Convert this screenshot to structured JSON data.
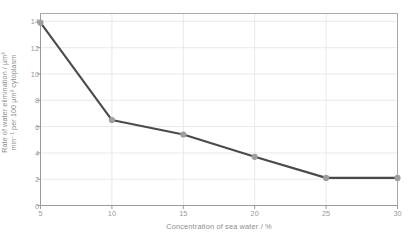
{
  "chart_data": {
    "type": "line",
    "title": "",
    "subtitle": "",
    "xlabel": "Concentration of sea water / %",
    "ylabel": "Rate of water elimination / µm³ min⁻¹ per 100 µm³ cytoplasm",
    "ylabel_line1": "Rate of water elimination / µm³",
    "ylabel_line2": "min⁻¹ per 100 µm³ cytoplasm",
    "x": [
      5,
      10,
      15,
      20,
      25,
      30
    ],
    "values": [
      13.9,
      6.5,
      5.4,
      3.7,
      2.1,
      2.1
    ],
    "series": [
      {
        "name": "Rate of water elimination",
        "values": [
          13.9,
          6.5,
          5.4,
          3.7,
          2.1,
          2.1
        ]
      }
    ],
    "xlim": [
      5,
      30
    ],
    "ylim": [
      0,
      14.6
    ],
    "xticks": [
      "5",
      "10",
      "15",
      "20",
      "25",
      "30"
    ],
    "yticks": [
      "0",
      "2",
      "4",
      "6",
      "8",
      "10",
      "12",
      "14"
    ],
    "xtick_values": [
      5,
      10,
      15,
      20,
      25,
      30
    ],
    "ytick_values": [
      0,
      2,
      4,
      6,
      8,
      10,
      12,
      14
    ],
    "grid": "both",
    "legend": "none",
    "marker": "circle",
    "colors": {
      "line": "#4a4a4a",
      "marker": "#9e9e9e",
      "grid": "#e6e6e6",
      "axis": "#9a9a9a",
      "frame": "#a8a8a8",
      "text": "#8d8d8d",
      "background": "#ffffff"
    }
  }
}
